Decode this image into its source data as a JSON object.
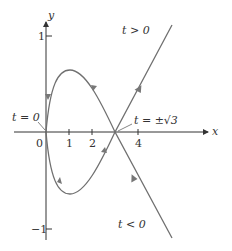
{
  "diagram": {
    "axes": {
      "x_label": "x",
      "y_label": "y",
      "x_ticks": [
        {
          "value": 0,
          "label": "0"
        },
        {
          "value": 1,
          "label": "1"
        },
        {
          "value": 2,
          "label": "2"
        },
        {
          "value": 4,
          "label": "4"
        }
      ],
      "y_ticks": [
        {
          "value": 1,
          "label": "1"
        },
        {
          "value": -1,
          "label": "−1"
        }
      ]
    },
    "annotations": {
      "t_zero": "t = 0",
      "t_sqrt3": "t = ±√3",
      "t_positive": "t > 0",
      "t_negative": "t < 0"
    },
    "colors": {
      "curve": "#6e6e6e",
      "axis": "#333333",
      "arrow": "#888888"
    }
  }
}
